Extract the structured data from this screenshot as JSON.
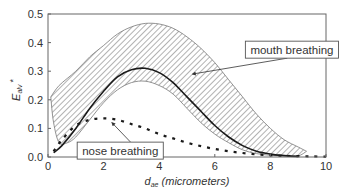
{
  "chart_data": {
    "type": "area",
    "title": "",
    "xlabel": "d_ae (micrometers)",
    "xlabel_main": "d",
    "xlabel_sub": "ae",
    "xlabel_unit": "(micrometers)",
    "ylabel": "E_alv *",
    "ylabel_main": "E",
    "ylabel_sub": "alv",
    "ylabel_sup": "*",
    "xlim": [
      0,
      10
    ],
    "ylim": [
      0,
      0.5
    ],
    "xticks": [
      "0",
      "2",
      "4",
      "6",
      "8",
      "10"
    ],
    "yticks": [
      "0.0",
      "0.1",
      "0.2",
      "0.3",
      "0.4",
      "0.5"
    ],
    "grid": false,
    "series": [
      {
        "name": "mouth breathing (upper envelope)",
        "style": "hatched-band-upper",
        "x": [
          0.1,
          0.4,
          1.0,
          1.5,
          2.0,
          2.5,
          3.0,
          3.5,
          4.0,
          4.5,
          5.0,
          5.5,
          6.0,
          6.5,
          7.0,
          7.5,
          8.0,
          8.5,
          9.0,
          9.3
        ],
        "y": [
          0.21,
          0.25,
          0.3,
          0.35,
          0.39,
          0.43,
          0.455,
          0.467,
          0.465,
          0.45,
          0.42,
          0.38,
          0.33,
          0.27,
          0.21,
          0.15,
          0.1,
          0.06,
          0.035,
          0.02
        ]
      },
      {
        "name": "mouth breathing (lower envelope)",
        "style": "hatched-band-lower",
        "x": [
          0.1,
          0.2,
          0.4,
          0.7,
          1.0,
          1.5,
          2.0,
          2.5,
          3.0,
          3.5,
          4.0,
          4.5,
          5.0,
          5.5,
          6.0,
          6.5,
          7.0,
          7.5,
          8.0,
          8.5,
          9.0,
          9.3
        ],
        "y": [
          0.21,
          0.12,
          0.05,
          0.05,
          0.07,
          0.13,
          0.19,
          0.235,
          0.26,
          0.265,
          0.25,
          0.22,
          0.17,
          0.12,
          0.08,
          0.05,
          0.025,
          0.012,
          0.006,
          0.004,
          0.004,
          0.02
        ]
      },
      {
        "name": "mouth breathing (typical)",
        "style": "solid",
        "x": [
          0.2,
          0.5,
          1.0,
          1.5,
          2.0,
          2.5,
          3.0,
          3.5,
          4.0,
          4.5,
          5.0,
          5.5,
          6.0,
          6.5,
          7.0,
          7.5,
          8.0,
          8.5,
          9.0
        ],
        "y": [
          0.015,
          0.04,
          0.1,
          0.17,
          0.23,
          0.28,
          0.305,
          0.31,
          0.295,
          0.26,
          0.21,
          0.16,
          0.11,
          0.07,
          0.04,
          0.02,
          0.01,
          0.005,
          0.002
        ]
      },
      {
        "name": "nose breathing",
        "style": "dashed",
        "x": [
          0.2,
          0.5,
          1.0,
          1.5,
          2.0,
          2.5,
          3.0,
          3.5,
          4.0,
          4.5,
          5.0,
          5.5,
          6.0,
          6.5,
          7.0,
          7.5,
          8.0,
          8.5,
          9.0,
          9.5,
          10.0
        ],
        "y": [
          0.02,
          0.06,
          0.11,
          0.13,
          0.135,
          0.13,
          0.115,
          0.1,
          0.08,
          0.065,
          0.05,
          0.038,
          0.028,
          0.02,
          0.014,
          0.009,
          0.006,
          0.004,
          0.003,
          0.002,
          0.001
        ]
      }
    ],
    "annotations": [
      {
        "text": "mouth breathing",
        "box_x": 7.1,
        "box_y": 0.405,
        "arrow_to_x": 5.2,
        "arrow_to_y": 0.29
      },
      {
        "text": "nose breathing",
        "box_x": 1.05,
        "box_y": 0.052,
        "arrow_to_x": 2.3,
        "arrow_to_y": 0.12
      }
    ]
  },
  "colors": {
    "line": "#1a1a1a",
    "hatch": "#555555",
    "frame": "#666666",
    "text": "#333333"
  }
}
